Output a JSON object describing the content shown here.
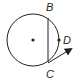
{
  "diagram": {
    "type": "circle-geometry",
    "circle": {
      "cx": 33,
      "cy": 40,
      "r": 26,
      "center_dot": true
    },
    "points": [
      {
        "label": "B",
        "x": 48,
        "y": 16,
        "label_x": 46,
        "label_y": 11
      },
      {
        "label": "C",
        "x": 48,
        "y": 64,
        "label_x": 46,
        "label_y": 78
      },
      {
        "label": "D",
        "x": 60,
        "y": 40,
        "label_x": 64,
        "label_y": 44
      }
    ],
    "segments": [
      {
        "from": "B",
        "to": "C",
        "name": "chord-bc"
      }
    ],
    "rays": [
      {
        "from": "C",
        "toward": [
          72,
          49
        ],
        "name": "tangent-ray"
      }
    ],
    "colors": {
      "stroke": "#231f20",
      "background": "#ffffff"
    }
  }
}
